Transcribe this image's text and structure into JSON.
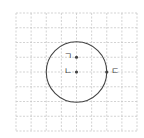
{
  "diagram": {
    "type": "grid-with-circle",
    "grid": {
      "columns": 8,
      "rows": 8,
      "left": 16,
      "top": 13,
      "right": 137,
      "bottom": 131,
      "line_color": "#c8c8c8",
      "line_style": "dashed"
    },
    "circle": {
      "center_grid": [
        4,
        4
      ],
      "radius_cells": 2,
      "stroke_color": "#444444"
    },
    "points": [
      {
        "label": "ㄱ",
        "grid": [
          4,
          3
        ],
        "label_side": "left"
      },
      {
        "label": "ㄴ",
        "grid": [
          4,
          4
        ],
        "label_side": "left",
        "note": "center of circle"
      },
      {
        "label": "ㄷ",
        "grid": [
          6,
          4
        ],
        "label_side": "right",
        "note": "on circle"
      }
    ],
    "point_color": "#444444"
  }
}
